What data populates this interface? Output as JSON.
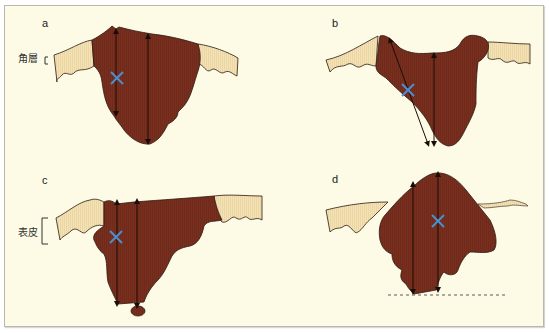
{
  "figure": {
    "panels": [
      {
        "id": "a",
        "label": "a",
        "side_label": "角層"
      },
      {
        "id": "b",
        "label": "b"
      },
      {
        "id": "c",
        "label": "c",
        "side_label": "表皮"
      },
      {
        "id": "d",
        "label": "d"
      }
    ],
    "colors": {
      "background": "#fdfbe6",
      "lesion": "#7a2f1e",
      "skin": "#f1dfb0",
      "outline": "#2a1a12",
      "marker_x": "#4a8fd0",
      "arrow": "#1a0d08"
    }
  }
}
